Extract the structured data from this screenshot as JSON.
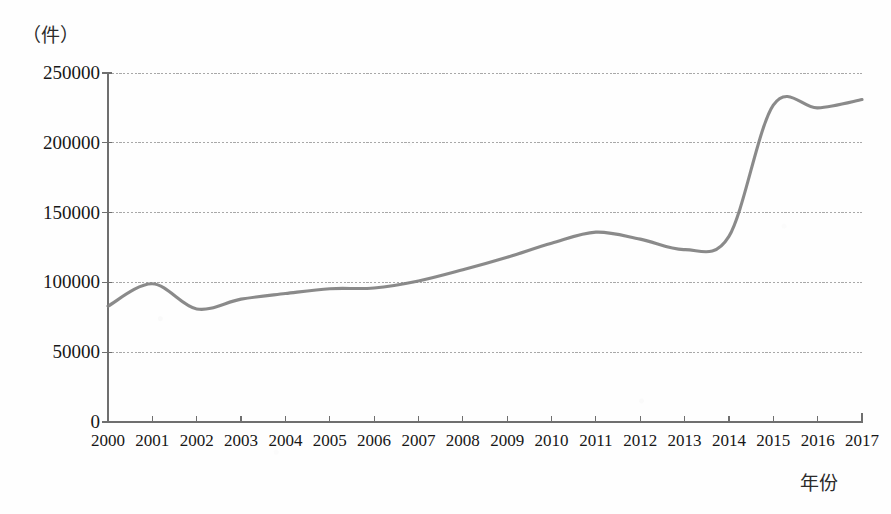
{
  "chart_data": {
    "type": "line",
    "title": "",
    "xlabel": "年份",
    "ylabel": "（件）",
    "unit_label": "（件）",
    "categories": [
      "2000",
      "2001",
      "2002",
      "2003",
      "2004",
      "2005",
      "2006",
      "2007",
      "2008",
      "2009",
      "2010",
      "2011",
      "2012",
      "2013",
      "2014",
      "2015",
      "2016",
      "2017"
    ],
    "x": [
      2000,
      2001,
      2002,
      2003,
      2004,
      2005,
      2006,
      2007,
      2008,
      2009,
      2010,
      2011,
      2012,
      2013,
      2014,
      2015,
      2016,
      2017
    ],
    "values": [
      83000,
      99000,
      81000,
      88000,
      92000,
      95500,
      96000,
      101000,
      109000,
      118000,
      128000,
      136000,
      131000,
      123500,
      133000,
      227000,
      225000,
      231000
    ],
    "series": [
      {
        "name": "件数",
        "color": "#808080",
        "values": [
          83000,
          99000,
          81000,
          88000,
          92000,
          95500,
          96000,
          101000,
          109000,
          118000,
          128000,
          136000,
          131000,
          123500,
          133000,
          227000,
          225000,
          231000
        ]
      }
    ],
    "ylim": [
      0,
      250000
    ],
    "yticks": [
      0,
      50000,
      100000,
      150000,
      200000,
      250000
    ],
    "ytick_labels": [
      "0",
      "50000",
      "100000",
      "150000",
      "200000",
      "250000"
    ],
    "xlim": [
      2000,
      2017
    ],
    "grid": true,
    "grid_axis": "y",
    "legend": false,
    "legend_position": "none",
    "line_color": "#808080",
    "grid_color": "#9a9a9a",
    "axis_color": "#6f6f6f",
    "text_color": "#171717",
    "background_color": "#fefefe",
    "smoothing": "spline"
  }
}
